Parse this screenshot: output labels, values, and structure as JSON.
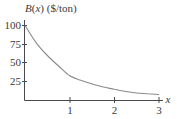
{
  "chart_data": {
    "type": "line",
    "title": "B(x) ($/ton)",
    "ylabel": "B(x) ($/ton)",
    "xlabel": "x",
    "xlim": [
      0,
      3
    ],
    "ylim": [
      0,
      100
    ],
    "x_ticks": [
      "1",
      "2",
      "3"
    ],
    "y_ticks": [
      "25",
      "50",
      "75",
      "100"
    ],
    "grid": false,
    "legend": null,
    "series": [
      {
        "name": "B(x)",
        "x": [
          0,
          0.25,
          0.5,
          0.75,
          1,
          1.25,
          1.5,
          1.75,
          2,
          2.25,
          2.5,
          2.75,
          3
        ],
        "values": [
          100,
          77,
          60,
          46,
          33,
          27,
          22,
          18,
          15,
          12,
          10,
          9,
          8
        ]
      }
    ]
  },
  "labels": {
    "title_func": "B",
    "title_var": "x",
    "title_unit": " ($/ton)",
    "x_axis": "x",
    "xt1": "1",
    "xt2": "2",
    "xt3": "3",
    "yt25": "25",
    "yt50": "50",
    "yt75": "75",
    "yt100": "100"
  },
  "colors": {
    "axis": "#4a4a4a",
    "curve": "#8a8a8a",
    "text": "#3a3a3a"
  }
}
